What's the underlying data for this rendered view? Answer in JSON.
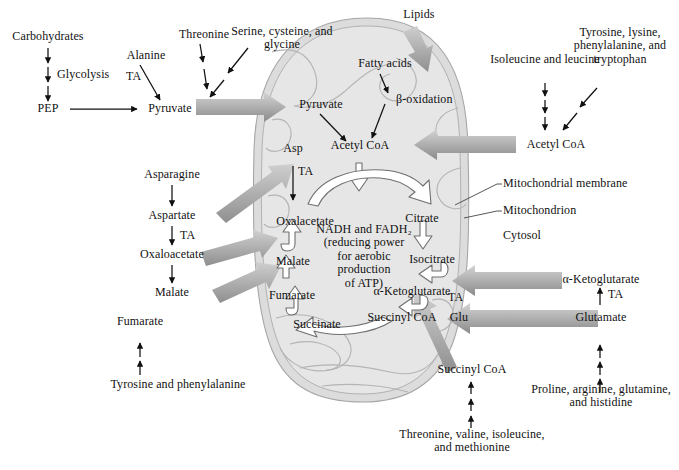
{
  "figure": {
    "organelle_labels": {
      "membrane": "Mitochondrial membrane",
      "mitochondrion": "Mitochondrion",
      "cytosol": "Cytosol"
    }
  },
  "colors": {
    "background": "#ffffff",
    "text": "#111111",
    "mito_fill": "#e3e3e3",
    "mito_outer": "#d7d7d7",
    "mito_stroke": "#a9a9a9",
    "crista_stroke": "#b0b0b0",
    "block_arrow_light": "#d2d2d2",
    "block_arrow_dark": "#8c8c8c",
    "hollow_arrow_fill": "#ffffff",
    "hollow_arrow_stroke": "#6f6f6f",
    "thin_arrow": "#111111",
    "leader_line": "#444444"
  },
  "cytosol_left": {
    "carbohydrates": "Carbohydrates",
    "glycolysis": "Glycolysis",
    "pep": "PEP",
    "pyruvate": "Pyruvate",
    "alanine": "Alanine",
    "alanine_enzyme": "TA",
    "threonine": "Threonine",
    "serine_group": "Serine, cysteine, and glycine"
  },
  "cytosol_left_lower": {
    "asparagine": "Asparagine",
    "aspartate": "Aspartate",
    "aspartate_enzyme": "TA",
    "oxaloacetate": "Oxaloacetate",
    "malate": "Malate",
    "fumarate": "Fumarate",
    "tyr_phe": "Tyrosine and phenylalanine"
  },
  "cytosol_top": {
    "lipids": "Lipids"
  },
  "cytosol_right": {
    "isoleucine_leucine": "Isoleucine and leucine",
    "tyr_lys_phe_trp": "Tyrosine, lysine, phenylalanine, and tryptophan",
    "acetyl_coa": "Acetyl CoA",
    "alpha_ketoglutarate": "α-Ketoglutarate",
    "glutamate_enzyme": "TA",
    "glutamate": "Glutamate",
    "proline_group": "Proline, arginine, glutamine, and histidine"
  },
  "cytosol_bottom": {
    "succinyl_coa": "Succinyl CoA",
    "thr_val_ile_met": "Threonine, valine, isoleucine, and methionine"
  },
  "matrix": {
    "pyruvate": "Pyruvate",
    "fatty_acids": "Fatty acids",
    "beta_oxidation": "β-oxidation",
    "acetyl_coa": "Acetyl CoA",
    "asp": "Asp",
    "asp_enzyme": "TA",
    "glu": "Glu",
    "glu_enzyme": "TA",
    "center_note": "NADH and FADH₂ (reducing power for aerobic production of ATP)",
    "center_note_lines": [
      "NADH and FADH₂",
      "(reducing power",
      "for aerobic",
      "production",
      "of ATP)"
    ]
  },
  "cycle_intermediates": [
    {
      "name": "Oxalacetate",
      "x": 305,
      "y": 215
    },
    {
      "name": "Citrate",
      "x": 420,
      "y": 212
    },
    {
      "name": "Isocitrate",
      "x": 430,
      "y": 253
    },
    {
      "name": "α-Ketoglutarate",
      "x": 412,
      "y": 285
    },
    {
      "name": "Succinyl CoA",
      "x": 400,
      "y": 312
    },
    {
      "name": "Succinate",
      "x": 317,
      "y": 318
    },
    {
      "name": "Fumarate",
      "x": 292,
      "y": 289
    },
    {
      "name": "Malate",
      "x": 293,
      "y": 255
    }
  ]
}
